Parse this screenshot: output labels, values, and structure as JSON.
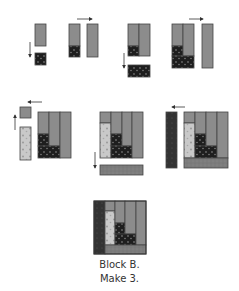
{
  "caption": {
    "line1": "Block B.",
    "line2": "Make 3."
  },
  "colors": {
    "gray_fabric": "#8c8c8c",
    "dark_fabric": "#1e1e1e",
    "charcoal_fabric": "#3a3a3a",
    "light_floral": "#c8c8c8",
    "mottled_gray": "#7a7a7a",
    "outline": "#444444",
    "arrow": "#333333"
  },
  "steps": [
    {
      "id": 1,
      "arrow": "down"
    },
    {
      "id": 2,
      "arrow": "right"
    },
    {
      "id": 3,
      "arrow": "down"
    },
    {
      "id": 4,
      "arrow": "left"
    },
    {
      "id": 5,
      "arrow": "left-and-up"
    },
    {
      "id": 6,
      "arrow": "down"
    },
    {
      "id": 7,
      "arrow": "left"
    }
  ],
  "final_block": {
    "label": "Block B"
  }
}
